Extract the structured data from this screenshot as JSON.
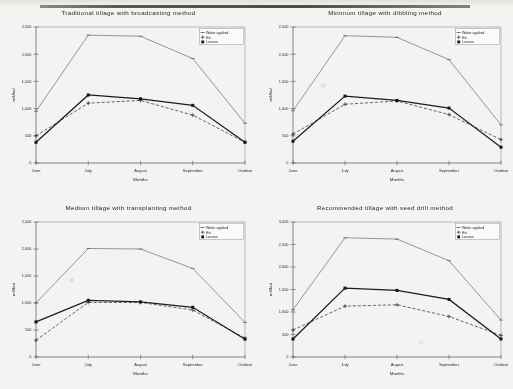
{
  "figure": {
    "background_color": "#f4f3f1",
    "panel_count": 4,
    "series_names": [
      "Water applied",
      "Etc",
      "Losses"
    ],
    "x_axis_title": "Months",
    "y_axis_title": "m3/fed",
    "categories": [
      "June",
      "July",
      "August",
      "September",
      "October"
    ]
  },
  "chart_data": [
    {
      "type": "line",
      "title": "Traditional tillage with broadcasting method",
      "xlabel": "Months",
      "ylabel": "m3/fed",
      "categories": [
        "June",
        "July",
        "August",
        "September",
        "October"
      ],
      "ylim": [
        0,
        2500
      ],
      "yticks": [
        0,
        500,
        1000,
        1500,
        2000,
        2500
      ],
      "yticklabels": [
        "0",
        "500",
        "1,000",
        "1,500",
        "2,000",
        "2,500"
      ],
      "grid": false,
      "legend_position": "top-right",
      "series": [
        {
          "name": "Water applied",
          "values": [
            950,
            2350,
            2330,
            1920,
            730
          ],
          "marker": "dash",
          "style": "thin-solid"
        },
        {
          "name": "Etc",
          "values": [
            500,
            1100,
            1150,
            880,
            380
          ],
          "marker": "plus",
          "style": "dashed"
        },
        {
          "name": "Losses",
          "values": [
            380,
            1250,
            1180,
            1060,
            380
          ],
          "marker": "square",
          "style": "thick-solid"
        }
      ]
    },
    {
      "type": "line",
      "title": "Minimum tillage with dibbling method",
      "xlabel": "Months",
      "ylabel": "m3/fed",
      "categories": [
        "June",
        "July",
        "August",
        "September",
        "October"
      ],
      "ylim": [
        0,
        2500
      ],
      "yticks": [
        0,
        500,
        1000,
        1500,
        2000,
        2500
      ],
      "yticklabels": [
        "0",
        "500",
        "1,000",
        "1,500",
        "2,000",
        "2,500"
      ],
      "grid": false,
      "legend_position": "top-right",
      "series": [
        {
          "name": "Water applied",
          "values": [
            960,
            2340,
            2310,
            1900,
            700
          ],
          "marker": "dash",
          "style": "thin-solid"
        },
        {
          "name": "Etc",
          "values": [
            530,
            1080,
            1140,
            890,
            430
          ],
          "marker": "plus",
          "style": "dashed"
        },
        {
          "name": "Losses",
          "values": [
            400,
            1230,
            1150,
            1010,
            290
          ],
          "marker": "square",
          "style": "thick-solid"
        }
      ]
    },
    {
      "type": "line",
      "title": "Medium tillage with transplanting method",
      "xlabel": "Months",
      "ylabel": "m3/fed",
      "categories": [
        "June",
        "July",
        "August",
        "September",
        "October"
      ],
      "ylim": [
        0,
        2500
      ],
      "yticks": [
        0,
        500,
        1000,
        1500,
        2000,
        2500
      ],
      "yticklabels": [
        "0",
        "500",
        "1,000",
        "1,500",
        "2,000",
        "2,500"
      ],
      "grid": false,
      "legend_position": "top-right",
      "series": [
        {
          "name": "Water applied",
          "values": [
            1000,
            2010,
            2000,
            1640,
            640
          ],
          "marker": "dash",
          "style": "thin-solid"
        },
        {
          "name": "Etc",
          "values": [
            310,
            1010,
            1010,
            870,
            350
          ],
          "marker": "plus",
          "style": "dashed"
        },
        {
          "name": "Losses",
          "values": [
            650,
            1050,
            1020,
            920,
            330
          ],
          "marker": "square",
          "style": "thick-solid"
        }
      ]
    },
    {
      "type": "line",
      "title": "Recommended tillage with seed drill method",
      "xlabel": "Months",
      "ylabel": "m3/fed",
      "categories": [
        "June",
        "July",
        "August",
        "September",
        "October"
      ],
      "ylim": [
        0,
        3000
      ],
      "yticks": [
        0,
        500,
        1000,
        1500,
        2000,
        2500,
        3000
      ],
      "yticklabels": [
        "0",
        "500",
        "1,000",
        "1,500",
        "2,000",
        "2,500",
        "3,000"
      ],
      "grid": false,
      "legend_position": "top-right",
      "series": [
        {
          "name": "Water applied",
          "values": [
            1050,
            2650,
            2620,
            2140,
            820
          ],
          "marker": "dash",
          "style": "thin-solid"
        },
        {
          "name": "Etc",
          "values": [
            600,
            1130,
            1160,
            900,
            480
          ],
          "marker": "plus",
          "style": "dashed"
        },
        {
          "name": "Losses",
          "values": [
            400,
            1530,
            1480,
            1280,
            400
          ],
          "marker": "square",
          "style": "thick-solid"
        }
      ]
    }
  ]
}
